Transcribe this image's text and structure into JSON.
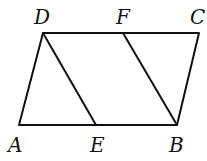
{
  "diagram": {
    "type": "parallelogram",
    "stroke_color": "#111111",
    "points": {
      "A": {
        "x": 19,
        "y": 125
      },
      "B": {
        "x": 177,
        "y": 125
      },
      "C": {
        "x": 199,
        "y": 33
      },
      "D": {
        "x": 43,
        "y": 33
      },
      "E": {
        "x": 96,
        "y": 125
      },
      "F": {
        "x": 123,
        "y": 33
      }
    },
    "segments": [
      [
        "A",
        "B"
      ],
      [
        "B",
        "C"
      ],
      [
        "C",
        "D"
      ],
      [
        "D",
        "A"
      ],
      [
        "D",
        "E"
      ],
      [
        "F",
        "B"
      ]
    ],
    "labels": {
      "A": "A",
      "B": "B",
      "C": "C",
      "D": "D",
      "E": "E",
      "F": "F"
    }
  }
}
